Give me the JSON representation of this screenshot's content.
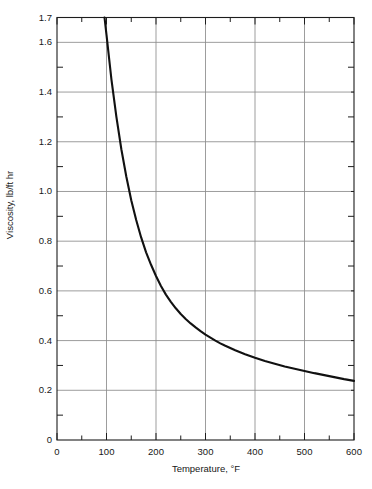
{
  "chart_data": {
    "type": "line",
    "title": "",
    "subtitle": "",
    "xlabel": "Temperature, °F",
    "ylabel": "Viscosity, lb/ft hr",
    "xlim": [
      0,
      600
    ],
    "ylim": [
      0,
      1.7
    ],
    "grid": true,
    "legend_position": "none",
    "x_major_ticks": [
      0,
      100,
      200,
      300,
      400,
      500,
      600
    ],
    "x_major_tick_labels": [
      "0",
      "100",
      "200",
      "300",
      "400",
      "500",
      "600"
    ],
    "x_minor_ticks": [
      50,
      150,
      250,
      350,
      450,
      550
    ],
    "y_major_ticks": [
      0,
      0.2,
      0.4,
      0.6,
      0.8,
      1.0,
      1.2,
      1.4,
      1.6,
      1.7
    ],
    "y_major_tick_labels": [
      "0",
      "0.2",
      "0.4",
      "0.6",
      "0.8",
      "1.0",
      "1.2",
      "1.4",
      "1.6",
      "1.7"
    ],
    "y_gridlines": [
      0.2,
      0.4,
      0.6,
      0.8,
      1.0,
      1.2,
      1.4,
      1.6
    ],
    "y_minor_ticks": [
      0.1,
      0.3,
      0.5,
      0.7,
      0.9,
      1.1,
      1.3,
      1.5
    ],
    "series": [
      {
        "name": "Viscosity vs Temperature",
        "color": "#111111",
        "line_width": 2.1,
        "x": [
          96,
          100,
          110,
          120,
          130,
          140,
          150,
          160,
          170,
          180,
          190,
          200,
          210,
          220,
          230,
          240,
          250,
          260,
          270,
          280,
          290,
          300,
          310,
          320,
          330,
          340,
          350,
          360,
          380,
          400,
          420,
          440,
          460,
          480,
          500,
          520,
          540,
          560,
          580,
          600
        ],
        "y": [
          1.7,
          1.63,
          1.45,
          1.3,
          1.17,
          1.06,
          0.965,
          0.885,
          0.815,
          0.755,
          0.705,
          0.66,
          0.62,
          0.585,
          0.556,
          0.53,
          0.507,
          0.487,
          0.469,
          0.453,
          0.438,
          0.424,
          0.412,
          0.4,
          0.389,
          0.379,
          0.37,
          0.361,
          0.345,
          0.331,
          0.318,
          0.307,
          0.296,
          0.287,
          0.278,
          0.269,
          0.261,
          0.253,
          0.245,
          0.238
        ]
      }
    ],
    "annotations": []
  },
  "axes": {
    "y_axis_title": "Viscosity, lb/ft hr",
    "x_axis_title": "Temperature, °F",
    "frame_color": "#1d1d1d",
    "grid_color": "#8b8b8b"
  }
}
